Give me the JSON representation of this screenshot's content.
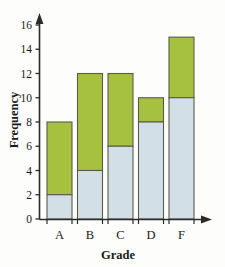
{
  "chart_data": {
    "type": "bar",
    "subtype": "stacked",
    "title": "",
    "xlabel": "Grade",
    "ylabel": "Frequency",
    "categories": [
      "A",
      "B",
      "C",
      "D",
      "F"
    ],
    "series": [
      {
        "name": "lower-segment",
        "color": "#d3dfe7",
        "values": [
          2,
          4,
          6,
          8,
          10
        ]
      },
      {
        "name": "upper-segment",
        "color": "#a6c13f",
        "values": [
          6,
          8,
          6,
          2,
          5
        ]
      }
    ],
    "totals": [
      8,
      12,
      12,
      10,
      15
    ],
    "ylim": [
      0,
      16
    ],
    "yticks": [
      0,
      2,
      4,
      6,
      8,
      10,
      12,
      14,
      16
    ],
    "ytick_labels": [
      "0",
      "2",
      "4",
      "6",
      "8",
      "10",
      "12",
      "14",
      "16"
    ],
    "grid": false,
    "legend": "none",
    "axis_arrows": true,
    "bar_outline_color": "#5a5a4a"
  },
  "axes": {
    "y_label": "Frequency",
    "x_label": "Grade"
  },
  "icons": {
    "y_axis_arrow": "arrow-up-icon",
    "x_axis_arrow": "arrow-right-icon"
  }
}
